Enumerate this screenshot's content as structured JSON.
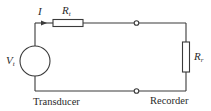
{
  "diagram": {
    "type": "circuit",
    "title": "",
    "components": {
      "source": {
        "symbol": "V",
        "subscript": "t",
        "kind": "voltage-source"
      },
      "current": {
        "symbol": "I",
        "kind": "current-arrow"
      },
      "series_resistor": {
        "symbol": "R",
        "subscript": "t",
        "kind": "resistor"
      },
      "load_resistor": {
        "symbol": "R",
        "subscript": "r",
        "kind": "resistor"
      },
      "terminals": [
        {
          "position": "top",
          "kind": "open-terminal"
        },
        {
          "position": "bottom",
          "kind": "open-terminal"
        }
      ]
    },
    "captions": {
      "left": "Transducer",
      "right": "Recorder"
    },
    "colors": {
      "line": "#3a3a3a",
      "background": "#ffffff",
      "text": "#2a2a2a"
    }
  }
}
